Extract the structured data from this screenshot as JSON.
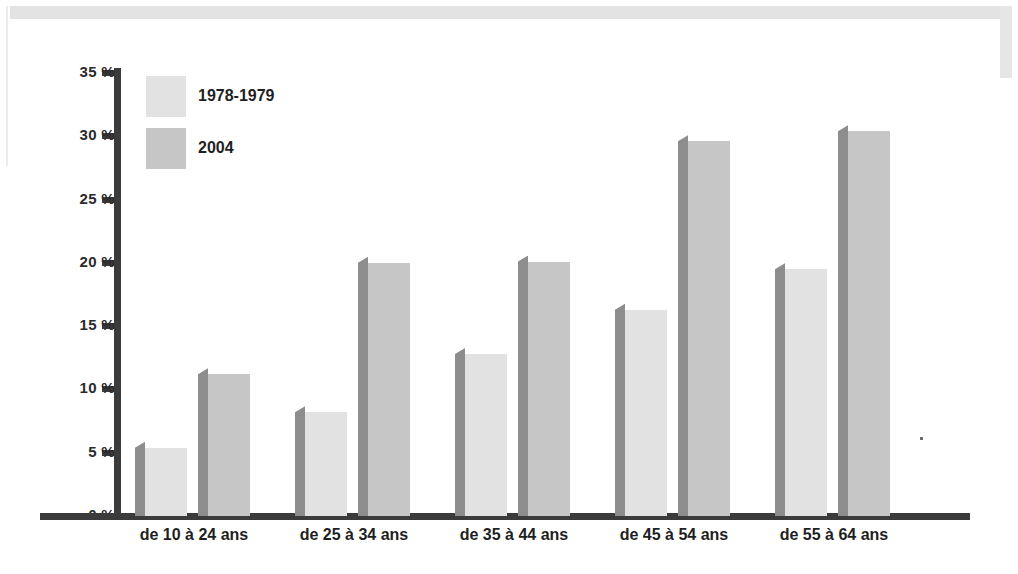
{
  "chart_data": {
    "type": "bar",
    "title": "",
    "xlabel": "",
    "ylabel": "",
    "ylim": [
      0,
      35
    ],
    "ytick_step": 5,
    "grid": false,
    "legend_position": "top-left",
    "categories": [
      "de 10 à 24 ans",
      "de 25 à 34 ans",
      "de 35 à 44 ans",
      "de 45 à 54 ans",
      "de 55 à 64 ans"
    ],
    "ytick_labels": [
      "0 %",
      "5 %",
      "10 %",
      "15 %",
      "20 %",
      "25 %",
      "30 %",
      "35 %"
    ],
    "ytick_values": [
      0,
      5,
      10,
      15,
      20,
      25,
      30,
      35
    ],
    "series": [
      {
        "name": "1978-1979",
        "color": "#e2e2e2",
        "values": [
          5.4,
          8.2,
          12.8,
          16.3,
          19.5
        ]
      },
      {
        "name": "2004",
        "color": "#c6c6c6",
        "values": [
          11.2,
          20.0,
          20.1,
          29.6,
          30.4
        ]
      }
    ]
  },
  "legend": {
    "items": [
      {
        "label": "1978-1979"
      },
      {
        "label": "2004"
      }
    ]
  },
  "colors": {
    "axis": "#3b3b3b",
    "bar_shadow": "#8d8d8d",
    "series_a": "#e2e2e2",
    "series_b": "#c6c6c6",
    "text": "#1f1f1f",
    "frame": "#e3e3e3",
    "background": "#ffffff"
  }
}
